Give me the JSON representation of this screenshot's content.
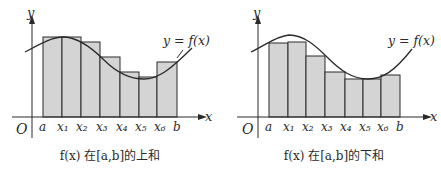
{
  "diagrams": [
    {
      "id": "upper",
      "caption": "f(x) 在[a,b]的上和",
      "curve_label": "y = f(x)",
      "axis_x_label": "x",
      "axis_y_label": "y",
      "origin_label": "O",
      "tick_labels": [
        "a",
        "x₁",
        "x₂",
        "x₃",
        "x₄",
        "x₅",
        "x₆",
        "b"
      ],
      "bar_fill": "#d4d4d4",
      "stroke": "#2a2a2a"
    },
    {
      "id": "lower",
      "caption": "f(x) 在[a,b]的下和",
      "curve_label": "y = f(x)",
      "axis_x_label": "x",
      "axis_y_label": "y",
      "origin_label": "O",
      "tick_labels": [
        "a",
        "x₁",
        "x₂",
        "x₃",
        "x₄",
        "x₅",
        "x₆",
        "b"
      ],
      "bar_fill": "#d4d4d4",
      "stroke": "#2a2a2a"
    }
  ]
}
